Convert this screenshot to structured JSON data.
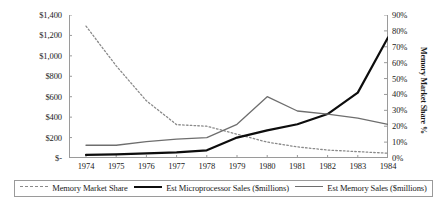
{
  "chart_data": {
    "type": "line",
    "title": "",
    "xlabel": "",
    "ylabel": "",
    "y2label": "Memory Market Share %",
    "categories": [
      "1974",
      "1975",
      "1976",
      "1977",
      "1978",
      "1979",
      "1980",
      "1981",
      "1982",
      "1983",
      "1984"
    ],
    "x": [
      1974,
      1975,
      1976,
      1977,
      1978,
      1979,
      1980,
      1981,
      1982,
      1983,
      1984
    ],
    "ylim": [
      0,
      1400
    ],
    "y2lim": [
      0,
      0.9
    ],
    "y_ticks": [
      "$-",
      "$200",
      "$400",
      "$600",
      "$800",
      "$1,000",
      "$1,200",
      "$1,400"
    ],
    "y_tick_values": [
      0,
      200,
      400,
      600,
      800,
      1000,
      1200,
      1400
    ],
    "y2_ticks": [
      "0%",
      "10%",
      "20%",
      "30%",
      "40%",
      "50%",
      "60%",
      "70%",
      "80%",
      "90%"
    ],
    "y2_tick_values": [
      0,
      10,
      20,
      30,
      40,
      50,
      60,
      70,
      80,
      90
    ],
    "grid": false,
    "legend_position": "bottom",
    "series": [
      {
        "name": "Memory Market Share",
        "axis": "right",
        "style": "dotted",
        "color": "#8a8a8a",
        "unit": "%",
        "values": [
          83,
          58,
          36,
          21,
          20,
          15,
          10,
          7,
          5,
          4,
          3
        ]
      },
      {
        "name": "Est Microprocessor Sales ($millions)",
        "axis": "left",
        "style": "solid-thick",
        "color": "#0d0d0d",
        "unit": "$millions",
        "values": [
          30,
          35,
          45,
          55,
          75,
          200,
          270,
          330,
          430,
          640,
          1180
        ]
      },
      {
        "name": "Est Memory Sales ($millions)",
        "axis": "left",
        "style": "solid-thin",
        "color": "#6e6e6e",
        "unit": "$millions",
        "values": [
          125,
          125,
          160,
          185,
          200,
          330,
          600,
          460,
          430,
          390,
          330
        ]
      }
    ]
  }
}
